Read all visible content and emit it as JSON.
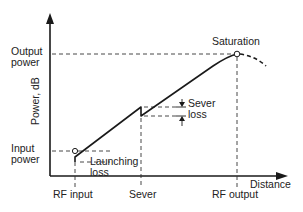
{
  "diagram": {
    "y_axis_label": "Power, dB",
    "x_axis_label": "Distance",
    "y_ticks": {
      "output_power": [
        "Output",
        "power"
      ],
      "input_power": [
        "Input",
        "power"
      ]
    },
    "x_ticks": {
      "rf_input": "RF input",
      "sever": "Sever",
      "rf_output": "RF output"
    },
    "annotations": {
      "saturation": "Saturation",
      "sever_loss": [
        "Sever",
        "loss"
      ],
      "launching_loss": [
        "Launching",
        "loss"
      ]
    },
    "colors": {
      "line": "#1a1a1a",
      "text": "#222222",
      "background": "#ffffff"
    }
  }
}
